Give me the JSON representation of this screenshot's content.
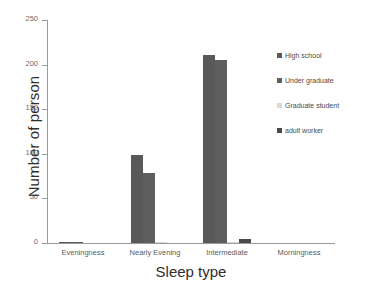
{
  "chart_data": {
    "type": "bar",
    "title": "",
    "subtitle": "",
    "xlabel": "Sleep type",
    "ylabel": "Number of person",
    "categories": [
      "Eveningness",
      "Nearly Evening",
      "Intermediate",
      "Morningness"
    ],
    "series": [
      {
        "name": "High school",
        "color": "#595959",
        "values": [
          1,
          99,
          211,
          0
        ]
      },
      {
        "name": "Under graduate",
        "color": "#5e5e5e",
        "values": [
          1,
          78,
          205,
          0
        ]
      },
      {
        "name": "Graduate student",
        "color": "#d8d8d8",
        "values": [
          0,
          1,
          1,
          0
        ]
      },
      {
        "name": "adult worker",
        "color": "#4a4a4a",
        "values": [
          0,
          0,
          4,
          0
        ]
      }
    ],
    "ylim": [
      0,
      250
    ],
    "yticks": [
      0,
      50,
      100,
      150,
      200,
      250
    ],
    "ytick_labels": [
      "0",
      "50",
      "100",
      "150",
      "200",
      "250"
    ],
    "grid": false,
    "legend_position": "right",
    "axis_color": "#9a9a9a",
    "background": "#ffffff"
  }
}
